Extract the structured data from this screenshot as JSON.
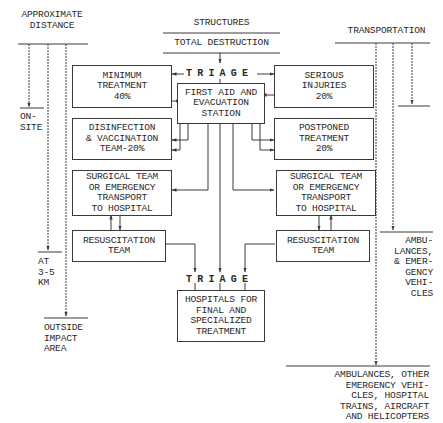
{
  "headers": {
    "distance": "APPROXIMATE\nDISTANCE",
    "structures": "STRUCTURES",
    "total_destruction": "TOTAL DESTRUCTION",
    "transportation": "TRANSPORTATION"
  },
  "distance_labels": {
    "on_site": "ON-\nSITE",
    "at_3_5_km": "AT\n3-5\nKM",
    "outside": "OUTSIDE\nIMPACT\nAREA"
  },
  "transport_labels": {
    "ambulances_emergency": "AMBU-\nLANCES,\n& EMER-\nGENCY\nVEHI-\nCLES",
    "all_transport": "AMBULANCES, OTHER\nEMERGENCY VEHI-\nCLES, HOSPITAL\nTRAINS, AIRCRAFT\nAND HELICOPTERS"
  },
  "triage_top": "TRIAGE",
  "triage_bottom": "TRIAGE",
  "boxes": {
    "minimum_treatment": "MINIMUM\nTREATMENT\n40%",
    "serious_injuries": "SERIOUS\nINJURIES\n20%",
    "first_aid_station": "FIRST AID AND\nEVACUATION\nSTATION",
    "disinfection": "DISINFECTION\n& VACCINATION\nTEAM-20%",
    "postponed_treatment": "POSTPONED\nTREATMENT\n20%",
    "surgical_left": "SURGICAL TEAM\nOR EMERGENCY\nTRANSPORT\nTO HOSPITAL",
    "surgical_right": "SURGICAL TEAM\nOR EMERGENCY\nTRANSPORT\nTO HOSPITAL",
    "resuscitation_left": "RESUSCITATION\nTEAM",
    "resuscitation_right": "RESUSCITATION\nTEAM",
    "hospitals": "HOSPITALS FOR\nFINAL AND\nSPECIALIZED\nTREATMENT"
  },
  "colors": {
    "line": "#3a3a3a",
    "text": "#2a2a2a",
    "background": "#ffffff"
  }
}
